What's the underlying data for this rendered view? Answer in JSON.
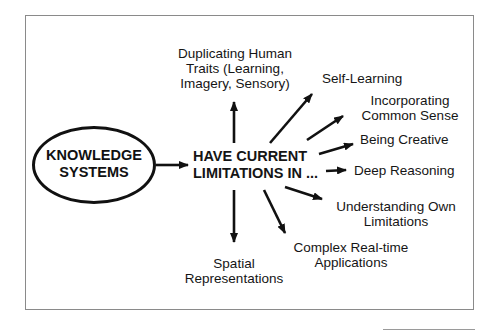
{
  "diagram": {
    "source_node": {
      "line1": "KNOWLEDGE",
      "line2": "SYSTEMS"
    },
    "center_node": {
      "line1": "HAVE CURRENT",
      "line2": "LIMITATIONS IN ..."
    },
    "limitations": [
      {
        "line1": "Duplicating Human",
        "line2": "Traits (Learning,",
        "line3": "Imagery, Sensory)"
      },
      {
        "line1": "Self-Learning"
      },
      {
        "line1": "Incorporating",
        "line2": "Common Sense"
      },
      {
        "line1": "Being Creative"
      },
      {
        "line1": "Deep Reasoning"
      },
      {
        "line1": "Understanding Own",
        "line2": "Limitations"
      },
      {
        "line1": "Complex Real-time",
        "line2": "Applications"
      },
      {
        "line1": "Spatial",
        "line2": "Representations"
      }
    ],
    "colors": {
      "ink": "#111111",
      "frame": "#8a8a8a",
      "background": "#ffffff"
    }
  }
}
